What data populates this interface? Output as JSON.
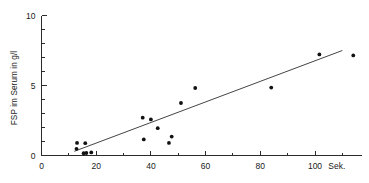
{
  "chart_data": {
    "type": "scatter",
    "title": "",
    "subtitle": "",
    "xlabel": "Sek.",
    "ylabel": "FSP im Serum in g/l",
    "xlim": [
      0,
      115
    ],
    "ylim": [
      0,
      10.6
    ],
    "grid": false,
    "legend": false,
    "x_ticks_major": [
      0,
      20,
      40,
      60,
      80,
      100
    ],
    "x_tick_labels": [
      "0",
      "20",
      "40",
      "60",
      "80",
      "100"
    ],
    "x_ticks_minor": [
      10,
      30,
      50,
      70,
      90,
      110
    ],
    "y_ticks_major": [
      0,
      5,
      10
    ],
    "y_tick_labels": [
      "0",
      "5",
      "10"
    ],
    "y_ticks_minor": [
      1,
      2,
      3,
      4,
      6,
      7,
      8,
      9
    ],
    "x_unit_label": "Sek.",
    "points": [
      {
        "x": 13.0,
        "y": 0.9
      },
      {
        "x": 12.8,
        "y": 0.48
      },
      {
        "x": 16.0,
        "y": 0.88
      },
      {
        "x": 15.4,
        "y": 0.16
      },
      {
        "x": 16.4,
        "y": 0.18
      },
      {
        "x": 18.2,
        "y": 0.22
      },
      {
        "x": 37.0,
        "y": 2.7
      },
      {
        "x": 37.4,
        "y": 1.15
      },
      {
        "x": 40.0,
        "y": 2.58
      },
      {
        "x": 42.5,
        "y": 1.95
      },
      {
        "x": 46.6,
        "y": 0.9
      },
      {
        "x": 47.6,
        "y": 1.35
      },
      {
        "x": 51.0,
        "y": 3.75
      },
      {
        "x": 56.2,
        "y": 4.82
      },
      {
        "x": 84.0,
        "y": 4.85
      },
      {
        "x": 101.6,
        "y": 7.22
      },
      {
        "x": 114.0,
        "y": 7.15
      }
    ],
    "trend_line": {
      "x_start": 12.0,
      "y_start": 0.3,
      "x_end": 110.0,
      "y_end": 7.5
    },
    "point_color": "#111111",
    "line_color": "#2f2f2f",
    "axis_color": "#2b2b2b",
    "background_color": "#ffffff"
  }
}
